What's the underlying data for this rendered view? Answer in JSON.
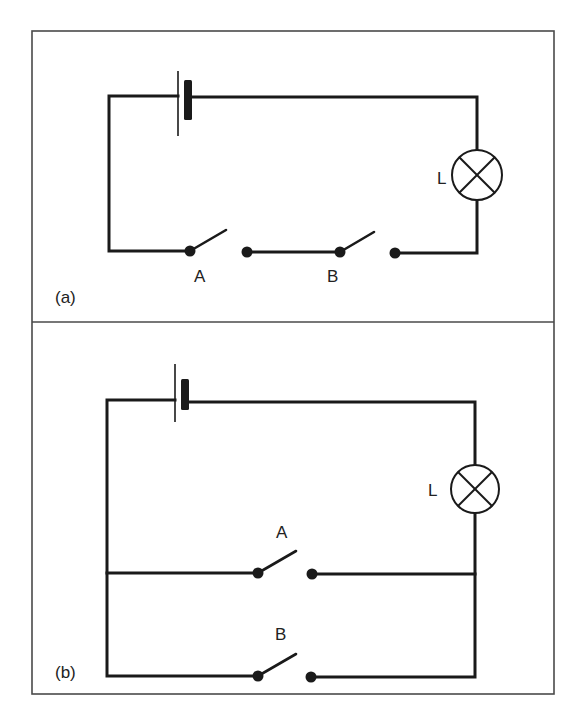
{
  "figure": {
    "colors": {
      "line": "#1a1a1a",
      "frame": "#4a4a4a",
      "background": "#ffffff"
    }
  },
  "panels": [
    {
      "id": "a",
      "label": "(a)",
      "arrangement": "series",
      "lamp_label": "L",
      "switch_labels": [
        "A",
        "B"
      ],
      "components": [
        "cell",
        "lamp",
        "switch-A",
        "switch-B"
      ],
      "switch_states": [
        "open",
        "open"
      ]
    },
    {
      "id": "b",
      "label": "(b)",
      "arrangement": "parallel",
      "lamp_label": "L",
      "switch_labels": [
        "A",
        "B"
      ],
      "components": [
        "cell",
        "lamp",
        "switch-A",
        "switch-B"
      ],
      "switch_states": [
        "open",
        "open"
      ]
    }
  ]
}
